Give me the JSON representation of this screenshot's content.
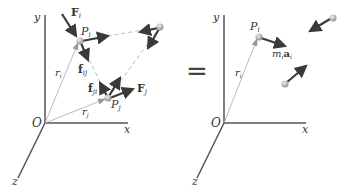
{
  "left_panel": {
    "axis_y": "y",
    "axis_x": "x",
    "axis_z": "z",
    "origin": "O",
    "Pi": "P",
    "Pi_sub": "i",
    "Pj": "P",
    "Pj_sub": "j",
    "ri": "r",
    "ri_sub": "i",
    "rj": "r",
    "rj_sub": "j",
    "Fi": "F",
    "Fi_sub": "i",
    "Fj": "F",
    "Fj_sub": "j",
    "fij": "f",
    "fij_sub": "ij",
    "fji": "f",
    "fji_sub": "ji"
  },
  "equals": "=",
  "right_panel": {
    "axis_y": "y",
    "axis_x": "x",
    "axis_z": "z",
    "origin": "O",
    "Pi": "P",
    "Pi_sub": "i",
    "ri": "r",
    "ri_sub": "i",
    "m": "m",
    "m_sub": "i",
    "a": "a",
    "a_sub": "i"
  },
  "colors": {
    "axis": "#555555",
    "arrow": "#3a3a3a",
    "position_line": "#aaaaaa",
    "particle": "#bbbbbb"
  }
}
